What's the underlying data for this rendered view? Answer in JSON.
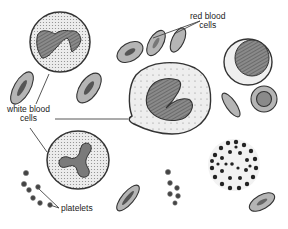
{
  "diagram": {
    "title": "Blood cells",
    "labels": {
      "red_blood_cells_line1": "red blood",
      "red_blood_cells_line2": "cells",
      "white_blood_cells_line1": "white blood",
      "white_blood_cells_line2": "cells",
      "platelets": "platelets"
    },
    "colors": {
      "background": "#ffffff",
      "outline": "#333333",
      "rbc_fill": "#b8b8b8",
      "rbc_center": "#8a8a8a",
      "wbc_cytoplasm": "#e6e6e6",
      "nucleus": "#6a6a6a",
      "granule": "#2a2a2a",
      "leader_line": "#444444"
    }
  }
}
